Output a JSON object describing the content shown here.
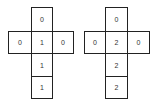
{
  "figures": [
    {
      "name": "left-cross-net",
      "cells": {
        "top": "0",
        "left": "0",
        "center": "1",
        "right": "0",
        "below1": "1",
        "below2": "1"
      }
    },
    {
      "name": "right-cross-net",
      "cells": {
        "top": "0",
        "left": "0",
        "center": "2",
        "right": "0",
        "below1": "2",
        "below2": "2"
      }
    }
  ],
  "colors": {
    "border": "#222222",
    "text": "#333333",
    "background": "#ffffff"
  }
}
